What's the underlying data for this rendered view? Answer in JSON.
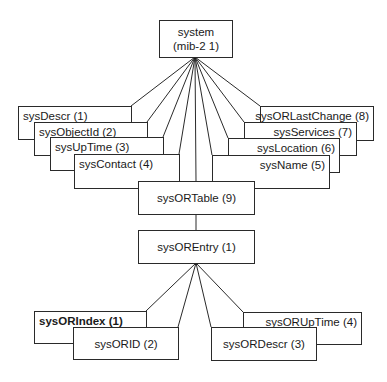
{
  "root": {
    "line1": "system",
    "line2": "(mib-2 1)"
  },
  "system_children_left": [
    {
      "label": "sysDescr (1)"
    },
    {
      "label": "sysObjectId (2)"
    },
    {
      "label": "sysUpTime (3)"
    },
    {
      "label": "sysContact (4)"
    }
  ],
  "system_children_right": [
    {
      "label": "sysORLastChange (8)"
    },
    {
      "label": "sysServices (7)"
    },
    {
      "label": "sysLocation (6)"
    },
    {
      "label": "sysName (5)"
    }
  ],
  "table": {
    "label": "sysORTable (9)"
  },
  "entry": {
    "label": "sysOREntry (1)"
  },
  "entry_children": [
    {
      "label": "sysORIndex (1)",
      "bold": true
    },
    {
      "label": "sysORID (2)"
    },
    {
      "label": "sysORDescr (3)"
    },
    {
      "label": "sysORUpTime (4)"
    }
  ],
  "colors": {
    "line": "#2a2a2a",
    "background": "#ffffff",
    "text": "#1a1a1a"
  }
}
